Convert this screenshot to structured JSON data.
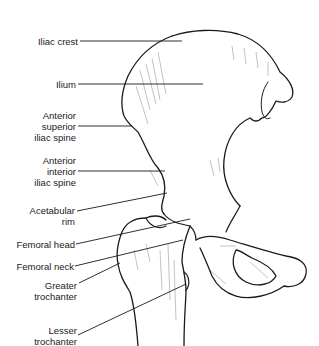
{
  "diagram": {
    "labels": [
      {
        "id": "iliac-crest",
        "lines": [
          "Iliac crest"
        ]
      },
      {
        "id": "ilium",
        "lines": [
          "Ilium"
        ]
      },
      {
        "id": "anterior-superior-iliac-spine",
        "lines": [
          "Anterior",
          "superior",
          "iliac spine"
        ]
      },
      {
        "id": "anterior-interior-iliac-spine",
        "lines": [
          "Anterior",
          "interior",
          "iliac spine"
        ]
      },
      {
        "id": "acetabular-rim",
        "lines": [
          "Acetabular",
          "rim"
        ]
      },
      {
        "id": "femoral-head",
        "lines": [
          "Femoral head"
        ]
      },
      {
        "id": "femoral-neck",
        "lines": [
          "Femoral neck"
        ]
      },
      {
        "id": "greater-trochanter",
        "lines": [
          "Greater",
          "trochanter"
        ]
      },
      {
        "id": "lesser-trochanter",
        "lines": [
          "Lesser",
          "trochanter"
        ]
      }
    ],
    "colors": {
      "line": "#1a1a1a",
      "background": "#ffffff",
      "shading": "#666666"
    }
  }
}
